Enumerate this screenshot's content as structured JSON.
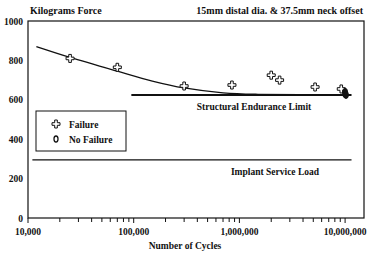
{
  "chart_data": {
    "type": "scatter",
    "title": "15mm distal dia. & 37.5mm neck offset",
    "ylabel": "Kilograms Force",
    "xlabel": "Number of Cycles",
    "xscale": "log",
    "xlim": [
      10000,
      12000000
    ],
    "ylim": [
      0,
      1000
    ],
    "x_ticks": [
      "10,000",
      "100,000",
      "1,000,000",
      "10,000,000"
    ],
    "x_tick_values": [
      10000,
      100000,
      1000000,
      10000000
    ],
    "y_ticks": [
      "0",
      "200",
      "400",
      "600",
      "800",
      "1000"
    ],
    "y_tick_values": [
      0,
      200,
      400,
      600,
      800,
      1000
    ],
    "grid": false,
    "legend": {
      "position": "left-middle",
      "entries": [
        {
          "label": "Failure",
          "marker": "cross"
        },
        {
          "label": "No Failure",
          "marker": "diamond"
        }
      ]
    },
    "series": [
      {
        "name": "Failure",
        "marker": "cross",
        "points": [
          {
            "x": 25000,
            "y": 810
          },
          {
            "x": 70000,
            "y": 765
          },
          {
            "x": 300000,
            "y": 670
          },
          {
            "x": 850000,
            "y": 675
          },
          {
            "x": 2000000,
            "y": 725
          },
          {
            "x": 2400000,
            "y": 700
          },
          {
            "x": 5200000,
            "y": 665
          },
          {
            "x": 9200000,
            "y": 655
          }
        ]
      },
      {
        "name": "No Failure",
        "marker": "diamond",
        "points": [
          {
            "x": 10000000,
            "y": 630
          },
          {
            "x": 10000000,
            "y": 640
          },
          {
            "x": 10200000,
            "y": 625
          }
        ]
      }
    ],
    "curve": {
      "name": "Fatigue curve fit",
      "points": [
        {
          "x": 12000,
          "y": 870
        },
        {
          "x": 25000,
          "y": 815
        },
        {
          "x": 70000,
          "y": 745
        },
        {
          "x": 150000,
          "y": 695
        },
        {
          "x": 300000,
          "y": 660
        },
        {
          "x": 700000,
          "y": 635
        },
        {
          "x": 1500000,
          "y": 628
        },
        {
          "x": 10000000,
          "y": 625
        }
      ]
    },
    "annotations": [
      {
        "text": "Structural Endurance Limit",
        "type": "hline",
        "y": 625,
        "x_start": 95000,
        "x_end": 11500000
      },
      {
        "text": "Implant Service Load",
        "type": "hline",
        "y": 295,
        "x_start": 11000,
        "x_end": 11500000
      }
    ]
  }
}
